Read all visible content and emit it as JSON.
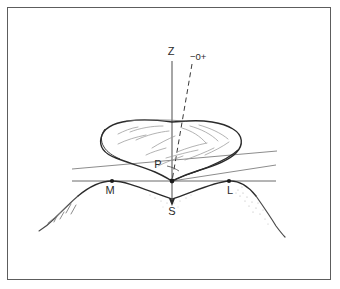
{
  "figure": {
    "kind": "anatomical-line-drawing",
    "background_color": "#ffffff",
    "border_color": "#5d5d5d",
    "ink_color": "#2b2b2b",
    "faint_ink_color": "#8a8a8a",
    "labels": {
      "axis_vertical": "Z",
      "axis_oblique": "−0+",
      "point_presenting": "P",
      "point_medial": "M",
      "point_station": "S",
      "point_lateral": "L"
    },
    "markers": [
      {
        "name": "M",
        "x": 112,
        "y": 181
      },
      {
        "name": "S",
        "x": 172,
        "y": 181
      },
      {
        "name": "L",
        "x": 229,
        "y": 181
      }
    ],
    "label_positions": {
      "Z": {
        "x": 171,
        "y": 55
      },
      "minus_zero_plus": {
        "x": 190,
        "y": 60
      },
      "P": {
        "x": 160,
        "y": 167
      },
      "M": {
        "x": 110,
        "y": 193
      },
      "S": {
        "x": 172,
        "y": 214
      },
      "L": {
        "x": 229,
        "y": 193
      }
    }
  }
}
